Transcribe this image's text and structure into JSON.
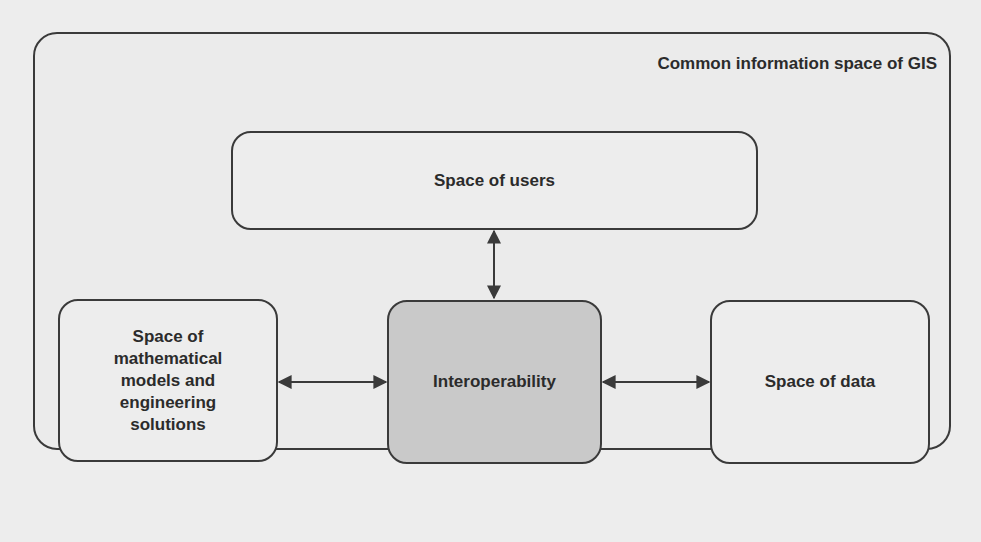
{
  "diagram": {
    "container": {
      "title": "Common information space of GIS"
    },
    "nodes": {
      "users": {
        "label": "Space of users"
      },
      "models": {
        "lines": [
          "Space of",
          "mathematical",
          "models and",
          "engineering",
          "solutions"
        ]
      },
      "interoperability": {
        "label": "Interoperability",
        "fill": "#c9c9c9"
      },
      "data": {
        "label": "Space of data"
      }
    },
    "edges": [
      {
        "from": "users",
        "to": "interoperability",
        "direction": "bidirectional"
      },
      {
        "from": "models",
        "to": "interoperability",
        "direction": "bidirectional"
      },
      {
        "from": "interoperability",
        "to": "data",
        "direction": "bidirectional"
      }
    ],
    "colors": {
      "stroke": "#3a3a3a",
      "background": "#ededed",
      "highlight_fill": "#c9c9c9",
      "text": "#2b2b2b"
    }
  }
}
